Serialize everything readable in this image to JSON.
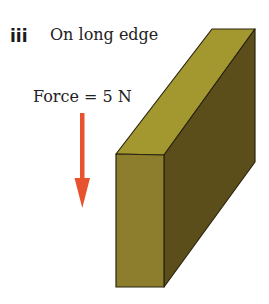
{
  "label": {
    "number": "iii",
    "text": "On long edge"
  },
  "force": {
    "text": "Force = 5 N",
    "direction": "down",
    "arrow_color": "#e8532f"
  },
  "block": {
    "orientation": "on long edge",
    "colors": {
      "front": "#8c7e2c",
      "top": "#a39830",
      "side": "#5c4e1a",
      "edge": "#2a2410"
    }
  }
}
